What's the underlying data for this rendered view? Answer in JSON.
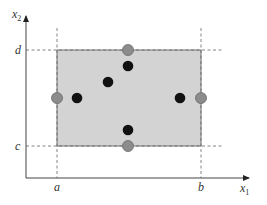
{
  "diagram": {
    "axes": {
      "x_label": "x",
      "x_sub": "1",
      "y_label": "x",
      "y_sub": "2"
    },
    "ticks": {
      "a": "a",
      "b": "b",
      "c": "c",
      "d": "d"
    },
    "colors": {
      "rect_fill": "#d3d3d3",
      "rect_stroke": "#777777",
      "gray_point": "#8c8c8c",
      "black_point": "#111111",
      "axis": "#444444",
      "dash": "#666666"
    },
    "rectangle": {
      "x1": "a",
      "x2": "b",
      "y1": "c",
      "y2": "d"
    },
    "boundary_points": [
      {
        "position": "top-center",
        "color": "gray"
      },
      {
        "position": "bottom-center",
        "color": "gray"
      },
      {
        "position": "left-center",
        "color": "gray"
      },
      {
        "position": "right-center",
        "color": "gray"
      }
    ],
    "interior_points": [
      {
        "position": "upper-center",
        "color": "black"
      },
      {
        "position": "upper-left-middle",
        "color": "black"
      },
      {
        "position": "left-middle",
        "color": "black"
      },
      {
        "position": "right-middle",
        "color": "black"
      },
      {
        "position": "lower-center",
        "color": "black"
      }
    ]
  }
}
